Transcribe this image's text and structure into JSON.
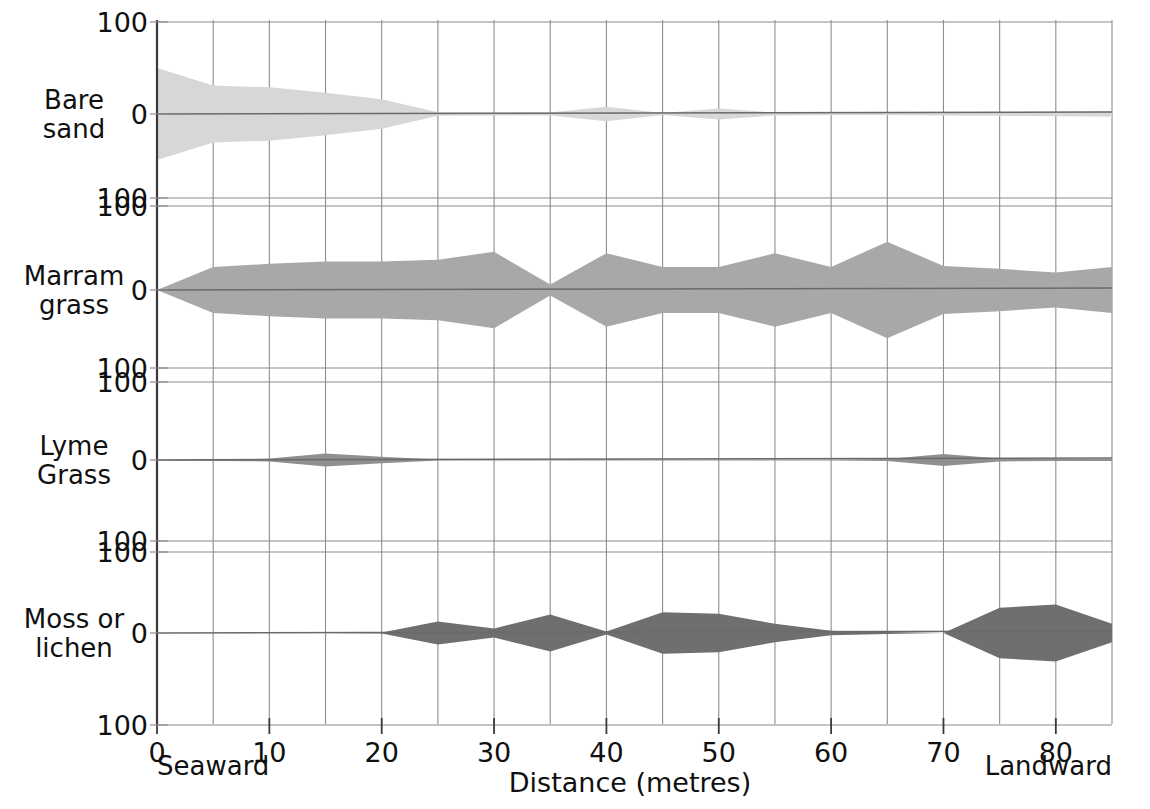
{
  "chart_data": {
    "type": "area",
    "subtype": "kite-diagram",
    "title": "",
    "xlabel": "Distance (metres)",
    "ylabel": "",
    "xlim": [
      0,
      85
    ],
    "ylim": [
      -100,
      100
    ],
    "grid": true,
    "legend_position": "none",
    "x_tick_labels": [
      "0",
      "10",
      "20",
      "30",
      "40",
      "50",
      "60",
      "70",
      "80"
    ],
    "x_ticks": [
      0,
      10,
      20,
      30,
      40,
      50,
      60,
      70,
      80
    ],
    "x_gridline_interval": 5,
    "y_tick_labels": [
      "100",
      "0",
      "100"
    ],
    "x_end_labels": {
      "left": "Seaward",
      "right": "Landward"
    },
    "x": [
      0,
      5,
      10,
      15,
      20,
      25,
      30,
      35,
      40,
      45,
      50,
      55,
      60,
      65,
      70,
      75,
      80,
      85
    ],
    "series": [
      {
        "name": "Bare sand",
        "label_lines": [
          "Bare",
          "sand"
        ],
        "color": "#d7d7d7",
        "values": [
          100,
          62,
          58,
          46,
          32,
          4,
          3,
          3,
          16,
          2,
          12,
          3,
          2,
          2,
          3,
          4,
          5,
          6
        ]
      },
      {
        "name": "Marram grass",
        "label_lines": [
          "Marram",
          "grass"
        ],
        "color": "#a8a8a8",
        "values": [
          0,
          50,
          57,
          62,
          62,
          66,
          83,
          12,
          80,
          50,
          50,
          80,
          50,
          105,
          52,
          46,
          38,
          50
        ]
      },
      {
        "name": "Lyme Grass",
        "label_lines": [
          "Lyme",
          "Grass"
        ],
        "color": "#909090",
        "values": [
          1,
          2,
          3,
          14,
          7,
          1,
          1,
          1,
          1,
          1,
          1,
          1,
          1,
          2,
          13,
          3,
          2,
          2
        ]
      },
      {
        "name": "Moss or lichen",
        "label_lines": [
          "Moss or",
          "lichen"
        ],
        "color": "#6f6f6f",
        "values": [
          0,
          0,
          0,
          0,
          1,
          25,
          10,
          40,
          3,
          45,
          42,
          20,
          5,
          2,
          0,
          55,
          62,
          20
        ]
      }
    ]
  },
  "axis": {
    "x_title": "Distance (metres)",
    "seaward": "Seaward",
    "landward": "Landward",
    "tick_100": "100",
    "tick_0": "0"
  }
}
